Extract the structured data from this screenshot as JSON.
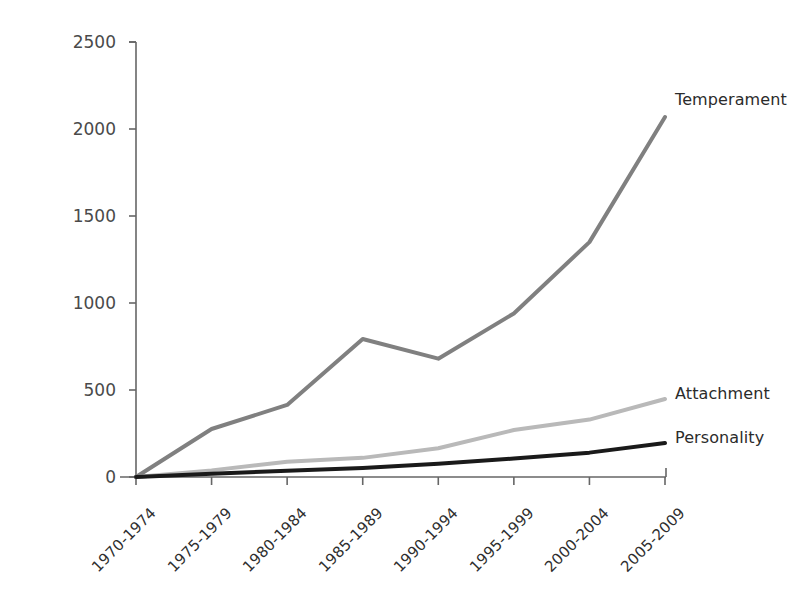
{
  "figure": {
    "background_color": "#ffffff",
    "axis_color": "#666666"
  },
  "chart_data": {
    "type": "line",
    "title": "",
    "subtitle": "",
    "xlabel": "",
    "ylabel": "Percent increase in publications (%)",
    "categories": [
      "1970-1974",
      "1975-1979",
      "1980-1984",
      "1985-1989",
      "1990-1994",
      "1995-1999",
      "2000-2004",
      "2005-2009"
    ],
    "yticks": [
      0,
      500,
      1000,
      1500,
      2000,
      2500
    ],
    "ytick_labels": [
      "0",
      "500",
      "1000",
      "1500",
      "2000",
      "2500"
    ],
    "ylim": [
      0,
      2500
    ],
    "grid": false,
    "legend_position": "right-of-line-ends",
    "series": [
      {
        "name": "Temperament",
        "color": "#808080",
        "line_width": 4,
        "values": [
          0,
          276,
          414,
          793,
          680,
          940,
          1350,
          2069
        ]
      },
      {
        "name": "Attachment",
        "color": "#b9b9b9",
        "line_width": 4,
        "values": [
          0,
          38,
          88,
          110,
          165,
          270,
          330,
          448
        ]
      },
      {
        "name": "Personality",
        "color": "#1a1a1a",
        "line_width": 4,
        "values": [
          0,
          18,
          36,
          52,
          76,
          106,
          140,
          195
        ]
      }
    ]
  },
  "annotations": {
    "temperament_label": "Temperament",
    "attachment_label": "Attachment",
    "personality_label": "Personality"
  }
}
